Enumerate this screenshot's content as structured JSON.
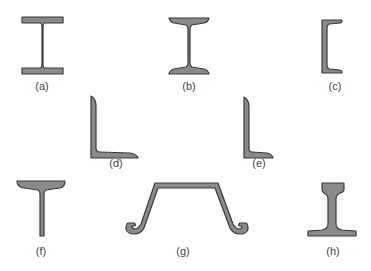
{
  "figure": {
    "colors": {
      "fill": "#8a8a8a",
      "outline": "#3a3a3a",
      "label": "#444444",
      "background": "#ffffff"
    },
    "sections": [
      {
        "id": "a",
        "label": "(a)",
        "shape": "wide-flange I-beam",
        "label_x": 42,
        "label_y": 78
      },
      {
        "id": "b",
        "label": "(b)",
        "shape": "tapered-flange I-beam (S-shape)",
        "label_x": 189,
        "label_y": 78
      },
      {
        "id": "c",
        "label": "(c)",
        "shape": "channel",
        "label_x": 336,
        "label_y": 80
      },
      {
        "id": "d",
        "label": "(d)",
        "shape": "equal-leg angle",
        "label_x": 116,
        "label_y": 156
      },
      {
        "id": "e",
        "label": "(e)",
        "shape": "unequal-leg angle",
        "label_x": 259,
        "label_y": 156
      },
      {
        "id": "f",
        "label": "(f)",
        "shape": "tee",
        "label_x": 41,
        "label_y": 245
      },
      {
        "id": "g",
        "label": "(g)",
        "shape": "sheet pile",
        "label_x": 184,
        "label_y": 245
      },
      {
        "id": "h",
        "label": "(h)",
        "shape": "rail",
        "label_x": 333,
        "label_y": 245
      }
    ]
  }
}
